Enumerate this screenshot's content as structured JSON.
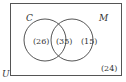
{
  "diagram": {
    "type": "venn",
    "universe_label": "U",
    "sets": [
      {
        "label": "C",
        "only_count": "(26)"
      },
      {
        "label": "M",
        "only_count": "(15)"
      }
    ],
    "intersection_count": "(35)",
    "outside_count": "(24)"
  }
}
